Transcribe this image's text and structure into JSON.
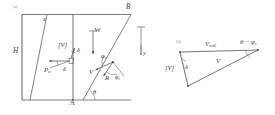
{
  "figure": {
    "caption_a": "(a)",
    "caption_b": "(b)"
  },
  "panel_a": {
    "name": "retaining-wall-failure-wedge",
    "vertices": {
      "top_inner": "x",
      "top_right": "B",
      "bottom_mid": "A"
    },
    "dimensions": {
      "wall_height": "H"
    },
    "axes": {
      "y_axis": "y"
    },
    "vectors": [
      {
        "name": "velocity-jump",
        "label": "[V]"
      },
      {
        "name": "weight",
        "label": "W"
      },
      {
        "name": "wall-reaction",
        "label": "P"
      },
      {
        "name": "wall-reaction-subscript",
        "label": "w"
      },
      {
        "name": "soil-reaction",
        "label": "R"
      }
    ],
    "angles": [
      {
        "name": "wall-friction-angle-upper",
        "label": "δ"
      },
      {
        "name": "wall-friction-angle-lower",
        "label": "δ"
      },
      {
        "name": "failure-plane-inclination",
        "label": "θ"
      },
      {
        "name": "soil-friction-angle-upper",
        "label": "φ"
      },
      {
        "name": "soil-friction-angle-sub-upper",
        "label": "s"
      },
      {
        "name": "soil-friction-angle-lower",
        "label": "φ"
      },
      {
        "name": "soil-friction-angle-sub-lower",
        "label": "s"
      }
    ]
  },
  "panel_b": {
    "name": "velocity-hodograph",
    "vectors": [
      {
        "name": "velocity-jump",
        "label": "[V]"
      },
      {
        "name": "wall-velocity",
        "label": "V",
        "sub": "wall"
      },
      {
        "name": "wedge-velocity",
        "label": "V"
      }
    ],
    "angles": [
      {
        "name": "wall-friction-angle",
        "label": "δ"
      },
      {
        "name": "theta-minus-phi",
        "label": "θ − φ",
        "sub": "s"
      }
    ]
  },
  "style": {
    "line_color": "#4a4a4a",
    "text_color": "#3a3a3a",
    "background": "#ffffff"
  }
}
